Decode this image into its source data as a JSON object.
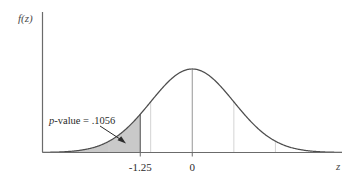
{
  "figure": {
    "type": "normal-distribution-pvalue-plot",
    "background_color": "#ffffff",
    "y_axis_label": "f(z)",
    "x_axis_label": "z",
    "annotation": {
      "prefix_italic": "p",
      "text": "-value = .1056",
      "full_text": "p-value = .1056",
      "value": 0.1056
    },
    "tick_labels": [
      {
        "text": "-1.25",
        "z": -1.25
      },
      {
        "text": "0",
        "z": 0
      }
    ],
    "colors": {
      "curve": "#4d4d4d",
      "axis": "#6b6b6b",
      "shading": "#c9c9c9",
      "shading_edge": "#6b6b6b",
      "gridline": "#cfcfcf",
      "text": "#2b2b2b"
    }
  },
  "chart_data": {
    "type": "line",
    "title": "",
    "subtitle": "",
    "xlabel": "z",
    "ylabel": "f(z)",
    "distribution": "standard normal",
    "mean": 0,
    "sd": 1,
    "xlim": [
      -3.6,
      3.6
    ],
    "ylim": [
      0,
      0.4
    ],
    "grid": true,
    "legend": false,
    "gridlines_z": [
      -2,
      -1,
      1,
      2
    ],
    "ticks_z": [
      -1.25,
      0
    ],
    "tick_text": [
      "-1.25",
      "0"
    ],
    "shaded_region": {
      "label": "p-value = .1056",
      "from_z": -3.6,
      "to_z": -1.25,
      "area": 0.1056,
      "fill": "#c9c9c9",
      "tail": "left"
    },
    "center_line_z": 0,
    "boundary_line_z": -1.25,
    "annotations": [
      {
        "text": "p-value = .1056",
        "points_to_z": -1.65,
        "arrow": true
      }
    ],
    "curve_points_z": [
      -3.6,
      -3.2,
      -2.8,
      -2.4,
      -2.0,
      -1.6,
      -1.25,
      -1.2,
      -0.8,
      -0.4,
      0,
      0.4,
      0.8,
      1.2,
      1.6,
      2.0,
      2.4,
      2.8,
      3.2,
      3.6
    ],
    "curve_points_density": [
      0.0006,
      0.0024,
      0.0079,
      0.0224,
      0.054,
      0.1109,
      0.1826,
      0.1942,
      0.2897,
      0.3683,
      0.3989,
      0.3683,
      0.2897,
      0.1942,
      0.1109,
      0.054,
      0.0224,
      0.0079,
      0.0024,
      0.0006
    ]
  }
}
